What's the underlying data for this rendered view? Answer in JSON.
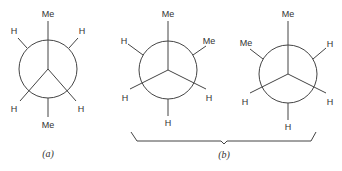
{
  "figure": {
    "type": "Newman projections",
    "panels": [
      {
        "id": "a",
        "caption": "(a)",
        "front_groups": [
          "Me",
          "H",
          "H"
        ],
        "back_groups": [
          "H",
          "H",
          "Me"
        ],
        "labels": {
          "front_top": "Me",
          "front_lower_left": "H",
          "front_lower_right": "H",
          "back_upper_left": "H",
          "back_upper_right": "H",
          "back_bottom": "Me"
        }
      },
      {
        "id": "b1",
        "labels": {
          "front_top": "Me",
          "front_lower_left": "H",
          "front_lower_right": "H",
          "back_upper_left": "H",
          "back_upper_right": "Me",
          "back_bottom": "H"
        }
      },
      {
        "id": "b2",
        "labels": {
          "front_top": "Me",
          "front_lower_left": "H",
          "front_lower_right": "H",
          "back_upper_left": "Me",
          "back_upper_right": "H",
          "back_bottom": "H"
        }
      }
    ],
    "group_caption": "(b)"
  }
}
